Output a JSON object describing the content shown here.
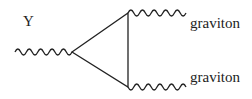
{
  "diagram": {
    "type": "feynman",
    "incoming": {
      "label": "Y",
      "kind": "wavy"
    },
    "loop": {
      "shape": "triangle"
    },
    "outgoing": [
      {
        "label": "graviton",
        "kind": "wavy"
      },
      {
        "label": "graviton",
        "kind": "wavy"
      }
    ],
    "colors": {
      "line": "#222222",
      "background": "#ffffff"
    }
  }
}
